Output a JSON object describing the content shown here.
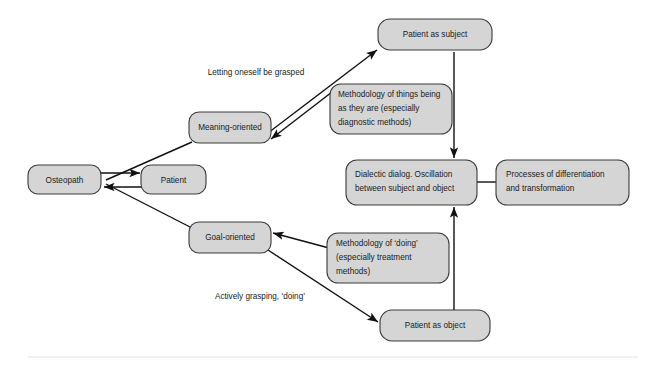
{
  "figure": {
    "type": "flow-diagram",
    "background_color": "#ffffff",
    "node_fill_color": "#d5d5d5",
    "node_border_color": "#3a3a3a",
    "edge_color": "#111111"
  },
  "nodes": {
    "osteopath": {
      "label": "Osteopath"
    },
    "patient": {
      "label": "Patient"
    },
    "meaning_oriented": {
      "label": "Meaning-oriented"
    },
    "goal_oriented": {
      "label": "Goal-oriented"
    },
    "patient_as_subject": {
      "label": "Patient as subject"
    },
    "patient_as_object": {
      "label": "Patient as object"
    },
    "dialectic_dialog": {
      "line1": "Dialectic dialog. Oscillation",
      "line2": "between subject and object"
    },
    "processes": {
      "line1": "Processes of differentiation",
      "line2": "and transformation"
    },
    "methodology_being": {
      "line1": "Methodology of things being",
      "line2": "as they are (especially",
      "line3": "diagnostic methods)"
    },
    "methodology_doing": {
      "line1": "Methodology of ‘doing’",
      "line2": "(especially treatment",
      "line3": "methods)"
    }
  },
  "edge_labels": {
    "letting_oneself_be_grasped": "Letting oneself be grasped",
    "actively_grasping_doing": "Actively grasping, ‘doing’"
  }
}
